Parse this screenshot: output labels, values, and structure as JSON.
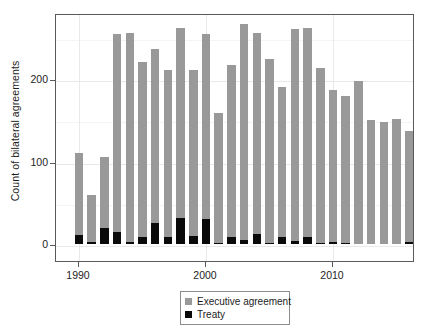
{
  "chart_data": {
    "type": "bar",
    "stacked": true,
    "title": "",
    "xlabel": "",
    "ylabel": "Count of bilateral agreements",
    "xlim": [
      1989.3,
      2016.7
    ],
    "ylim": [
      0,
      275
    ],
    "ytick_values": [
      0,
      100,
      200
    ],
    "ytick_labels": [
      "0",
      "100",
      "200"
    ],
    "xtick_values": [
      1990,
      2000,
      2010
    ],
    "xtick_labels": [
      "1990",
      "2000",
      "2010"
    ],
    "grid": true,
    "legend_position": "below-center",
    "categories": [
      1990,
      1991,
      1992,
      1993,
      1994,
      1995,
      1996,
      1997,
      1998,
      1999,
      2000,
      2001,
      2002,
      2003,
      2004,
      2005,
      2006,
      2007,
      2008,
      2009,
      2010,
      2011,
      2012,
      2013,
      2014,
      2015,
      2016
    ],
    "series": [
      {
        "name": "Executive agreement",
        "color": "#999999",
        "values": [
          99,
          57,
          87,
          241,
          254,
          212,
          211,
          202,
          231,
          201,
          224,
          158,
          209,
          262,
          244,
          223,
          182,
          257,
          253,
          212,
          184,
          179,
          197,
          150,
          148,
          151,
          134
        ]
      },
      {
        "name": "Treaty",
        "color": "#0a0a0a",
        "values": [
          11,
          2,
          19,
          14,
          2,
          9,
          25,
          9,
          31,
          10,
          30,
          1,
          8,
          5,
          12,
          1,
          8,
          4,
          9,
          1,
          3,
          1,
          0,
          0,
          0,
          0,
          3
        ]
      }
    ],
    "totals": [
      110,
      59,
      106,
      255,
      256,
      221,
      236,
      211,
      262,
      211,
      254,
      159,
      217,
      267,
      256,
      224,
      190,
      261,
      262,
      213,
      187,
      180,
      197,
      150,
      148,
      151,
      137
    ]
  },
  "legend": {
    "items": [
      {
        "label": "Executive agreement",
        "swatch": "exec"
      },
      {
        "label": "Treaty",
        "swatch": "treaty"
      }
    ]
  }
}
